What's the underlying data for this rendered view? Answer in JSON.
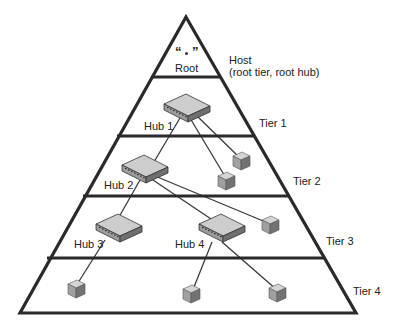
{
  "diagram": {
    "root": {
      "symbol_open": "“",
      "symbol_close": "”",
      "label": "Root"
    },
    "host_label": "Host",
    "host_sublabel": "(root tier, root hub)",
    "tiers": [
      {
        "label": "Tier 1"
      },
      {
        "label": "Tier 2"
      },
      {
        "label": "Tier 3"
      },
      {
        "label": "Tier 4"
      }
    ],
    "hubs": [
      {
        "label": "Hub 1",
        "tier": 1
      },
      {
        "label": "Hub 2",
        "tier": 2
      },
      {
        "label": "Hub 3",
        "tier": 3
      },
      {
        "label": "Hub 4",
        "tier": 3
      }
    ],
    "devices": [
      {
        "parent": "Hub 1",
        "tier": 2
      },
      {
        "parent": "Hub 1",
        "tier": 2
      },
      {
        "parent": "Hub 2",
        "tier": 3
      },
      {
        "parent": "Hub 3",
        "tier": 4
      },
      {
        "parent": "Hub 4",
        "tier": 4
      },
      {
        "parent": "Hub 4",
        "tier": 4
      }
    ],
    "colors": {
      "outline": "#2a2a2a",
      "hub_top": "#c8c8c8",
      "hub_front": "#8a8a8a",
      "device_top": "#cfcfcf",
      "device_front": "#9a9a9a",
      "device_side": "#6e6e6e"
    }
  }
}
